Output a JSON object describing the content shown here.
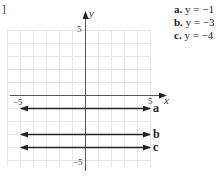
{
  "corner_mark": "]",
  "legend": [
    {
      "label": "a.",
      "equation": "y = −1"
    },
    {
      "label": "b.",
      "equation": "y = −3"
    },
    {
      "label": "c.",
      "equation": "y = −4"
    }
  ],
  "axes": {
    "x_label": "x",
    "y_label": "y",
    "x_min_tick": "−5",
    "x_max_tick": "5",
    "y_max_tick": "5",
    "y_min_tick": "−5"
  },
  "line_labels": [
    "a",
    "b",
    "c"
  ],
  "chart_data": {
    "type": "line",
    "title": "",
    "xlabel": "x",
    "ylabel": "y",
    "xlim": [
      -5,
      5
    ],
    "ylim": [
      -5,
      5
    ],
    "grid": true,
    "series": [
      {
        "name": "a",
        "equation": "y = -1",
        "x": [
          -5,
          5
        ],
        "y": [
          -1,
          -1
        ]
      },
      {
        "name": "b",
        "equation": "y = -3",
        "x": [
          -5,
          5
        ],
        "y": [
          -3,
          -3
        ]
      },
      {
        "name": "c",
        "equation": "y = -4",
        "x": [
          -5,
          5
        ],
        "y": [
          -4,
          -4
        ]
      }
    ],
    "legend_position": "top-right"
  }
}
